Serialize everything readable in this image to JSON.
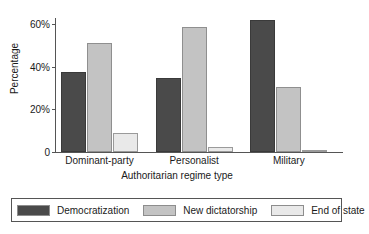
{
  "chart_data": {
    "type": "bar",
    "title": "",
    "xlabel": "Authoritarian regime type",
    "ylabel": "Percentage",
    "categories": [
      "Dominant-party",
      "Personalist",
      "Military"
    ],
    "series": [
      {
        "name": "Democratization",
        "color": "#4a4a4a",
        "values": [
          37.5,
          34.5,
          62.0
        ]
      },
      {
        "name": "New dictatorship",
        "color": "#c3c3c3",
        "values": [
          51.0,
          58.5,
          30.5
        ]
      },
      {
        "name": "End of state",
        "color": "#e9e9e9",
        "values": [
          9.0,
          2.5,
          1.0
        ]
      }
    ],
    "ylim": [
      0,
      65
    ],
    "yticks": [
      {
        "value": 0,
        "label": "0"
      },
      {
        "value": 20,
        "label": "20%"
      },
      {
        "value": 40,
        "label": "40%"
      },
      {
        "value": 60,
        "label": "60%"
      }
    ],
    "grid": false,
    "legend_position": "bottom"
  },
  "legend": {
    "entries": [
      {
        "label": "Democratization"
      },
      {
        "label": "New dictatorship"
      },
      {
        "label": "End of state"
      }
    ]
  }
}
